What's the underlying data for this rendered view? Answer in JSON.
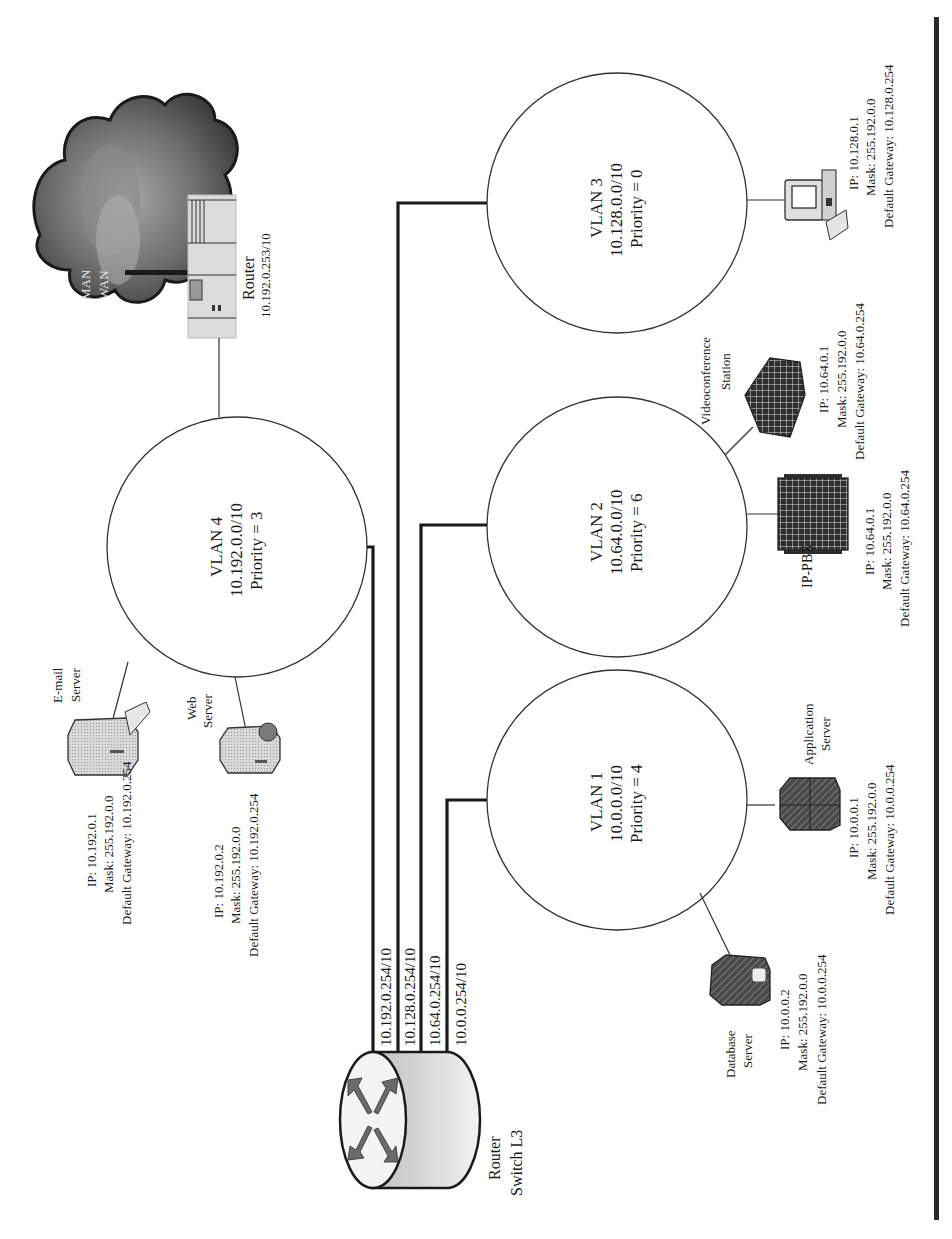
{
  "diagram": {
    "orientation": "rotated-90-ccw",
    "colors": {
      "line": "#1a1a1a",
      "bar": "#2a2a2a",
      "cloud_dark": "#3a3a3a",
      "cloud_light": "#9a9a9a",
      "device_fill": "#d0d0d0"
    },
    "wan": {
      "label_1": "MAN",
      "label_2": "WAN"
    },
    "edge_router": {
      "label": "Router",
      "ip": "10.192.0.253/10"
    },
    "core_switch": {
      "label_1": "Router",
      "label_2": "Switch L3",
      "interfaces": [
        "10.192.0.254/10",
        "10.128.0.254/10",
        "10.64.0.254/10",
        "10.0.0.254/10"
      ]
    },
    "vlans": [
      {
        "name": "VLAN 4",
        "subnet": "10.192.0.0/10",
        "priority": "Priority = 3"
      },
      {
        "name": "VLAN 3",
        "subnet": "10.128.0.0/10",
        "priority": "Priority = 0"
      },
      {
        "name": "VLAN 2",
        "subnet": "10.64.0.0/10",
        "priority": "Priority = 6"
      },
      {
        "name": "VLAN 1",
        "subnet": "10.0.0.0/10",
        "priority": "Priority = 4"
      }
    ],
    "devices": {
      "email_server": {
        "label_1": "E-mail",
        "label_2": "Server",
        "ip": "IP: 10.192.0.1",
        "mask": "Mask: 255.192.0.0",
        "gateway": "Default Gateway: 10.192.0.254"
      },
      "web_server": {
        "label_1": "Web",
        "label_2": "Server",
        "ip": "IP: 10.192.0.2",
        "mask": "Mask: 255.192.0.0",
        "gateway": "Default Gateway: 10.192.0.254"
      },
      "workstation": {
        "ip": "IP: 10.128.0.1",
        "mask": "Mask: 255.192.0.0",
        "gateway": "Default Gateway: 10.128.0.254"
      },
      "videoconference": {
        "label_1": "Videoconference",
        "label_2": "Station",
        "ip": "IP: 10.64.0.1",
        "mask": "Mask: 255.192.0.0",
        "gateway": "Default Gateway: 10.64.0.254"
      },
      "ip_pbx": {
        "label": "IP-PBX",
        "ip": "IP: 10.64.0.1",
        "mask": "Mask: 255.192.0.0",
        "gateway": "Default Gateway: 10.64.0.254"
      },
      "application_server": {
        "label_1": "Application",
        "label_2": "Server",
        "ip": "IP: 10.0.0.1",
        "mask": "Mask: 255.192.0.0",
        "gateway": "Default Gateway: 10.0.0.254"
      },
      "database_server": {
        "label_1": "Database",
        "label_2": "Server",
        "ip": "IP: 10.0.0.2",
        "mask": "Mask: 255.192.0.0",
        "gateway": "Default Gateway: 10.0.0.254"
      }
    }
  }
}
